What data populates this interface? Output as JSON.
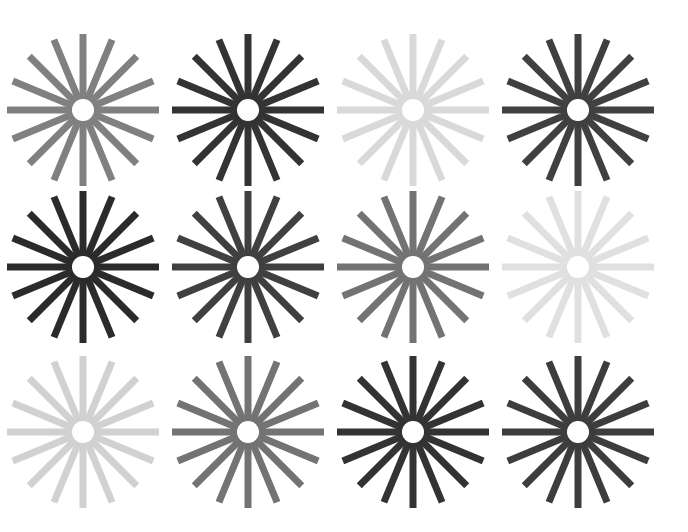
{
  "figure": {
    "title": "",
    "background_color": "#ffffff",
    "width": 688,
    "height": 532
  },
  "chart_data": {
    "type": "scatter",
    "title": "",
    "xlabel": "",
    "ylabel": "",
    "grid": false,
    "legend": "none",
    "layout": {
      "columns": 4,
      "rows": 3,
      "spokes_per_star": 16,
      "column_centers_px": [
        83,
        248,
        413,
        578
      ],
      "row_centers_px": [
        110,
        267,
        432
      ]
    },
    "marker_geometry": {
      "outer_radius_px": 76,
      "inner_radius_px": 12,
      "hub_radius_px": 11,
      "spoke_width_px": 7,
      "spoke_angle_step_deg": 22.5,
      "hub_color": "#ffffff"
    },
    "categories": [
      "r1c1",
      "r1c2",
      "r1c3",
      "r1c4",
      "r2c1",
      "r2c2",
      "r2c3",
      "r2c4",
      "r3c1",
      "r3c2",
      "r3c3",
      "r3c4"
    ],
    "values": [
      50,
      20,
      85,
      25,
      17,
      25,
      45,
      88,
      82,
      45,
      20,
      24
    ],
    "stars": [
      {
        "id": "r1c1",
        "row": 1,
        "col": 1,
        "cx": 83,
        "cy": 110,
        "spokes": 16,
        "color": "#808080",
        "lightness_pct": 50
      },
      {
        "id": "r1c2",
        "row": 1,
        "col": 2,
        "cx": 248,
        "cy": 110,
        "spokes": 16,
        "color": "#333333",
        "lightness_pct": 20
      },
      {
        "id": "r1c3",
        "row": 1,
        "col": 3,
        "cx": 413,
        "cy": 110,
        "spokes": 16,
        "color": "#d9d9d9",
        "lightness_pct": 85
      },
      {
        "id": "r1c4",
        "row": 1,
        "col": 4,
        "cx": 578,
        "cy": 110,
        "spokes": 16,
        "color": "#404040",
        "lightness_pct": 25
      },
      {
        "id": "r2c1",
        "row": 2,
        "col": 1,
        "cx": 83,
        "cy": 267,
        "spokes": 16,
        "color": "#2b2b2b",
        "lightness_pct": 17
      },
      {
        "id": "r2c2",
        "row": 2,
        "col": 2,
        "cx": 248,
        "cy": 267,
        "spokes": 16,
        "color": "#404040",
        "lightness_pct": 25
      },
      {
        "id": "r2c3",
        "row": 2,
        "col": 3,
        "cx": 413,
        "cy": 267,
        "spokes": 16,
        "color": "#737373",
        "lightness_pct": 45
      },
      {
        "id": "r2c4",
        "row": 2,
        "col": 4,
        "cx": 578,
        "cy": 267,
        "spokes": 16,
        "color": "#e0e0e0",
        "lightness_pct": 88
      },
      {
        "id": "r3c1",
        "row": 3,
        "col": 1,
        "cx": 83,
        "cy": 432,
        "spokes": 16,
        "color": "#d1d1d1",
        "lightness_pct": 82
      },
      {
        "id": "r3c2",
        "row": 3,
        "col": 2,
        "cx": 248,
        "cy": 432,
        "spokes": 16,
        "color": "#737373",
        "lightness_pct": 45
      },
      {
        "id": "r3c3",
        "row": 3,
        "col": 3,
        "cx": 413,
        "cy": 432,
        "spokes": 16,
        "color": "#333333",
        "lightness_pct": 20
      },
      {
        "id": "r3c4",
        "row": 3,
        "col": 4,
        "cx": 578,
        "cy": 432,
        "spokes": 16,
        "color": "#3d3d3d",
        "lightness_pct": 24
      }
    ]
  }
}
